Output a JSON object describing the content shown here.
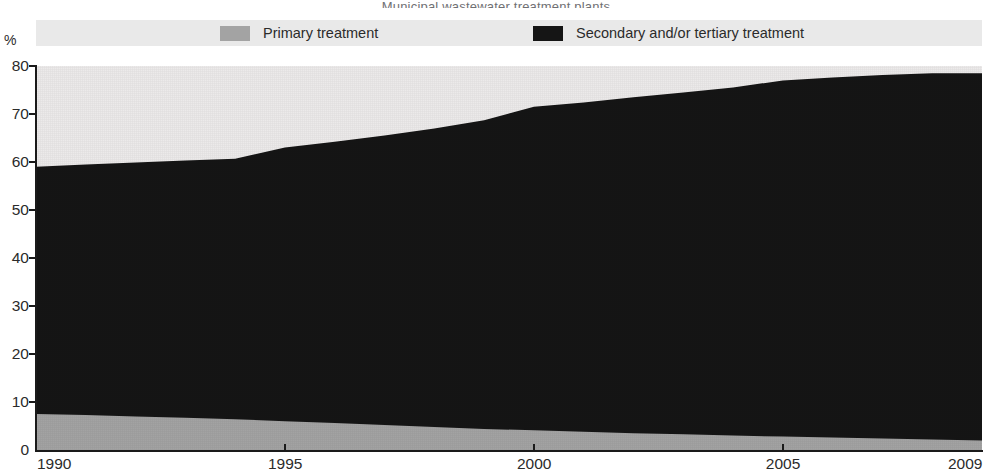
{
  "title_sliver": "Municipal wastewater treatment plants",
  "axis": {
    "unit_label": "%",
    "y_ticks": [
      0,
      10,
      20,
      30,
      40,
      50,
      60,
      70,
      80
    ],
    "x_ticks": [
      "1990",
      "1995",
      "2000",
      "2005",
      "2009"
    ]
  },
  "legend": {
    "items": [
      {
        "label": "Primary treatment",
        "color": "#a3a3a3",
        "swatch": "gray-swatch"
      },
      {
        "label": "Secondary and/or tertiary treatment",
        "color": "#151515",
        "swatch": "black-swatch"
      }
    ]
  },
  "colors": {
    "primary": "#a3a3a3",
    "secondary": "#151515",
    "plot_background": "#eceaea",
    "legend_background": "#e9e9e9",
    "axis": "#1a1a1a"
  },
  "chart_data": {
    "type": "area",
    "stacked": true,
    "title": "Municipal wastewater treatment plants",
    "xlabel": "",
    "ylabel": "%",
    "ylim": [
      0,
      80
    ],
    "xlim": [
      1990,
      2009
    ],
    "grid": false,
    "legend_position": "top",
    "x": [
      1990,
      1991,
      1992,
      1993,
      1994,
      1995,
      1996,
      1997,
      1998,
      1999,
      2000,
      2001,
      2002,
      2003,
      2004,
      2005,
      2006,
      2007,
      2008,
      2009
    ],
    "series": [
      {
        "name": "Primary treatment",
        "color": "#a3a3a3",
        "values": [
          7.5,
          7.3,
          7.0,
          6.7,
          6.4,
          6.0,
          5.6,
          5.2,
          4.8,
          4.4,
          4.1,
          3.8,
          3.5,
          3.3,
          3.0,
          2.8,
          2.6,
          2.4,
          2.2,
          2.0
        ]
      },
      {
        "name": "Secondary and/or tertiary treatment",
        "color": "#151515",
        "values": [
          51.5,
          52.2,
          52.9,
          53.6,
          54.3,
          57.0,
          58.6,
          60.3,
          62.2,
          64.3,
          67.4,
          68.6,
          70.0,
          71.2,
          72.5,
          74.2,
          75.0,
          75.7,
          76.3,
          76.5
        ]
      }
    ],
    "totals": [
      59.0,
      59.5,
      59.9,
      60.3,
      60.7,
      63.0,
      64.2,
      65.5,
      67.0,
      68.7,
      71.5,
      72.4,
      73.5,
      74.5,
      75.5,
      77.0,
      77.6,
      78.1,
      78.5,
      78.5
    ]
  }
}
